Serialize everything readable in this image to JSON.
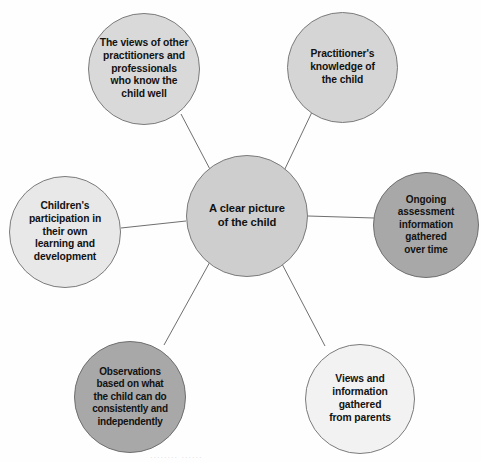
{
  "diagram": {
    "hub": {
      "id": "hub",
      "label": "A clear picture\nof the child",
      "fill": "#cecece",
      "stroke": "#7b7b7b"
    },
    "nodes": [
      {
        "id": "other-practitioners",
        "label": "The views of other\npractitioners and\nprofessionals\nwho know the\nchild well",
        "fill": "#d9d9d9",
        "stroke": "#7b7b7b",
        "position": "top-left"
      },
      {
        "id": "practitioner-knowledge",
        "label": "Practitioner's\nknowledge of\nthe child",
        "fill": "#d5d5d5",
        "stroke": "#7b7b7b",
        "position": "top-right"
      },
      {
        "id": "children-participation",
        "label": "Children's\nparticipation in\ntheir own\nlearning and\ndevelopment",
        "fill": "#e8e8e8",
        "stroke": "#7b7b7b",
        "position": "left"
      },
      {
        "id": "ongoing-assessment",
        "label": "Ongoing\nassessment\ninformation\ngathered\nover time",
        "fill": "#a8a8a8",
        "stroke": "#6f6f6f",
        "position": "right"
      },
      {
        "id": "observations",
        "label": "Observations\nbased on what\nthe child can do\nconsistently and\nindependently",
        "fill": "#a8a8a8",
        "stroke": "#6f6f6f",
        "position": "bottom-left"
      },
      {
        "id": "views-from-parents",
        "label": "Views and\ninformation\ngathered\nfrom parents",
        "fill": "#f2f2f2",
        "stroke": "#7b7b7b",
        "position": "bottom-right"
      }
    ],
    "connectors": {
      "stroke": "#6f6f6f",
      "width": 1,
      "edges": [
        {
          "from": "hub",
          "to": "other-practitioners",
          "x1": 213,
          "y1": 175,
          "x2": 181,
          "y2": 114
        },
        {
          "from": "hub",
          "to": "practitioner-knowledge",
          "x1": 283,
          "y1": 173,
          "x2": 312,
          "y2": 112
        },
        {
          "from": "hub",
          "to": "children-participation",
          "x1": 186,
          "y1": 221,
          "x2": 121,
          "y2": 228
        },
        {
          "from": "hub",
          "to": "ongoing-assessment",
          "x1": 308,
          "y1": 216,
          "x2": 374,
          "y2": 218
        },
        {
          "from": "hub",
          "to": "observations",
          "x1": 211,
          "y1": 260,
          "x2": 164,
          "y2": 345
        },
        {
          "from": "hub",
          "to": "views-from-parents",
          "x1": 281,
          "y1": 262,
          "x2": 325,
          "y2": 346
        }
      ]
    },
    "artifact_text": "........  ......"
  }
}
